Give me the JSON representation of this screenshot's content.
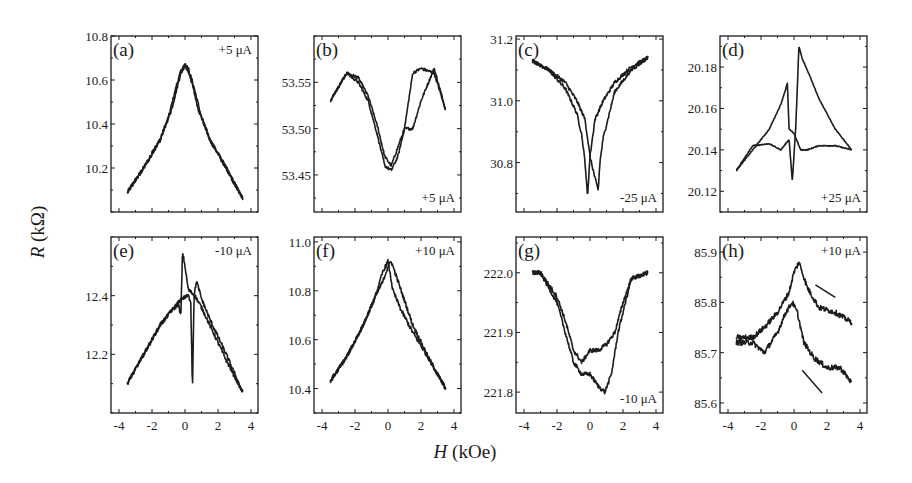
{
  "figure": {
    "ylabel_var": "R",
    "ylabel_unit": "(kΩ)",
    "xlabel_var": "H",
    "xlabel_unit": "(kOe)"
  },
  "chart_data": [
    {
      "panel": "(a)",
      "type": "line",
      "current": "+5 μA",
      "xlabel": "H (kOe)",
      "ylabel": "R (kΩ)",
      "xlim": [
        -4,
        4
      ],
      "ylim": [
        10.0,
        10.8
      ],
      "xticks": [
        -4,
        -2,
        0,
        2,
        4
      ],
      "xtick_labels_visible": false,
      "yticks": [
        10.2,
        10.4,
        10.6,
        10.8
      ],
      "ytick_labels": [
        "10.2",
        "10.4",
        "10.6",
        "10.8"
      ],
      "label_pos": "top-right",
      "noise": 0.012,
      "series": [
        {
          "name": "sweep up",
          "x": [
            -3.5,
            -2.5,
            -1.5,
            -1.0,
            -0.5,
            -0.2,
            0.0,
            0.3,
            0.8,
            1.5,
            2.5,
            3.5
          ],
          "y": [
            10.09,
            10.2,
            10.33,
            10.43,
            10.58,
            10.65,
            10.67,
            10.62,
            10.47,
            10.33,
            10.2,
            10.06
          ]
        },
        {
          "name": "sweep down",
          "x": [
            -3.5,
            -2.5,
            -1.5,
            -0.8,
            -0.3,
            0.0,
            0.2,
            0.5,
            1.0,
            1.5,
            2.5,
            3.5
          ],
          "y": [
            10.09,
            10.2,
            10.33,
            10.47,
            10.62,
            10.67,
            10.65,
            10.58,
            10.43,
            10.33,
            10.2,
            10.06
          ]
        }
      ]
    },
    {
      "panel": "(b)",
      "type": "line",
      "current": "+5 μA",
      "xlabel": "H (kOe)",
      "ylabel": "R (kΩ)",
      "xlim": [
        -4,
        4
      ],
      "ylim": [
        53.41,
        53.6
      ],
      "xticks": [
        -4,
        -2,
        0,
        2,
        4
      ],
      "xtick_labels_visible": false,
      "yticks": [
        53.45,
        53.5,
        53.55
      ],
      "ytick_labels": [
        "53.45",
        "53.50",
        "53.55"
      ],
      "label_pos": "bottom-right",
      "noise": 0.008,
      "series": [
        {
          "name": "sweep up",
          "x": [
            -3.5,
            -2.5,
            -1.8,
            -1.2,
            -0.6,
            -0.2,
            0.2,
            0.6,
            1.0,
            1.5,
            2.0,
            2.8,
            3.5
          ],
          "y": [
            53.53,
            53.56,
            53.555,
            53.535,
            53.5,
            53.47,
            53.46,
            53.48,
            53.5,
            53.5,
            53.53,
            53.565,
            53.52
          ]
        },
        {
          "name": "sweep down",
          "x": [
            -3.5,
            -2.5,
            -1.8,
            -1.2,
            -0.6,
            -0.2,
            0.2,
            0.6,
            1.0,
            1.5,
            2.0,
            2.8,
            3.5
          ],
          "y": [
            53.53,
            53.56,
            53.55,
            53.53,
            53.49,
            53.46,
            53.455,
            53.47,
            53.5,
            53.56,
            53.565,
            53.56,
            53.52
          ]
        }
      ]
    },
    {
      "panel": "(c)",
      "type": "line",
      "current": "-25 μA",
      "xlabel": "H (kOe)",
      "ylabel": "R (kΩ)",
      "xlim": [
        -4,
        4
      ],
      "ylim": [
        30.64,
        31.21
      ],
      "xticks": [
        -4,
        -2,
        0,
        2,
        4
      ],
      "xtick_labels_visible": false,
      "yticks": [
        30.8,
        31.0,
        31.2
      ],
      "ytick_labels": [
        "30.8",
        "31.0",
        "31.2"
      ],
      "label_pos": "bottom-right",
      "noise": 0.01,
      "series": [
        {
          "name": "sweep up",
          "x": [
            -3.5,
            -2.5,
            -1.5,
            -0.8,
            -0.5,
            -0.3,
            -0.15,
            0.0,
            0.3,
            0.8,
            1.5,
            2.5,
            3.5
          ],
          "y": [
            31.13,
            31.1,
            31.04,
            30.96,
            30.89,
            30.8,
            30.69,
            30.82,
            30.94,
            31.0,
            31.06,
            31.11,
            31.14
          ]
        },
        {
          "name": "sweep down",
          "x": [
            -3.5,
            -2.5,
            -1.5,
            -0.8,
            -0.3,
            0.0,
            0.3,
            0.5,
            0.6,
            0.8,
            1.5,
            2.5,
            3.5
          ],
          "y": [
            31.13,
            31.1,
            31.06,
            31.0,
            30.94,
            30.82,
            30.75,
            30.71,
            30.8,
            30.88,
            31.03,
            31.1,
            31.14
          ]
        }
      ]
    },
    {
      "panel": "(d)",
      "type": "line",
      "current": "+25 μA",
      "xlabel": "H (kOe)",
      "ylabel": "R (kΩ)",
      "xlim": [
        -4,
        4
      ],
      "ylim": [
        20.11,
        20.195
      ],
      "xticks": [
        -4,
        -2,
        0,
        2,
        4
      ],
      "xtick_labels_visible": false,
      "yticks": [
        20.12,
        20.14,
        20.16,
        20.18
      ],
      "ytick_labels": [
        "20.12",
        "20.14",
        "20.16",
        "20.18"
      ],
      "label_pos": "bottom-right",
      "noise": 0.0025,
      "series": [
        {
          "name": "sweep up",
          "x": [
            -3.5,
            -2.5,
            -1.5,
            -0.8,
            -0.4,
            -0.3,
            0.0,
            0.4,
            0.8,
            1.5,
            2.5,
            3.5
          ],
          "y": [
            20.13,
            20.14,
            20.15,
            20.162,
            20.172,
            20.15,
            20.148,
            20.14,
            20.14,
            20.142,
            20.142,
            20.14
          ]
        },
        {
          "name": "sweep down",
          "x": [
            -3.5,
            -2.5,
            -1.5,
            -0.8,
            -0.3,
            -0.1,
            0.1,
            0.3,
            0.5,
            1.0,
            1.5,
            2.5,
            3.5
          ],
          "y": [
            20.13,
            20.142,
            20.143,
            20.14,
            20.145,
            20.125,
            20.15,
            20.19,
            20.184,
            20.175,
            20.165,
            20.15,
            20.14
          ]
        }
      ]
    },
    {
      "panel": "(e)",
      "type": "line",
      "current": "-10 μA",
      "xlabel": "H (kOe)",
      "ylabel": "R (kΩ)",
      "xlim": [
        -4,
        4
      ],
      "ylim": [
        12.0,
        12.6
      ],
      "xticks": [
        -4,
        -2,
        0,
        2,
        4
      ],
      "xtick_labels": [
        "-4",
        "-2",
        "0",
        "2",
        "4"
      ],
      "xtick_labels_visible": true,
      "yticks": [
        12.2,
        12.4
      ],
      "ytick_labels": [
        "12.2",
        "12.4"
      ],
      "label_pos": "top-right",
      "noise": 0.011,
      "series": [
        {
          "name": "sweep up",
          "x": [
            -3.5,
            -2.5,
            -1.5,
            -0.8,
            -0.4,
            -0.25,
            -0.15,
            0.0,
            0.2,
            0.6,
            1.0,
            1.5,
            2.5,
            3.5
          ],
          "y": [
            12.1,
            12.2,
            12.3,
            12.35,
            12.37,
            12.33,
            12.55,
            12.5,
            12.42,
            12.4,
            12.36,
            12.3,
            12.18,
            12.07
          ]
        },
        {
          "name": "sweep down",
          "x": [
            -3.5,
            -2.5,
            -1.5,
            -0.8,
            -0.2,
            0.2,
            0.35,
            0.45,
            0.55,
            0.7,
            1.0,
            1.5,
            2.5,
            3.5
          ],
          "y": [
            12.1,
            12.2,
            12.3,
            12.35,
            12.39,
            12.4,
            12.38,
            12.08,
            12.4,
            12.45,
            12.39,
            12.32,
            12.2,
            12.07
          ]
        }
      ]
    },
    {
      "panel": "(f)",
      "type": "line",
      "current": "+10 μA",
      "xlabel": "H (kOe)",
      "ylabel": "R (kΩ)",
      "xlim": [
        -4,
        4
      ],
      "ylim": [
        10.3,
        11.02
      ],
      "xticks": [
        -4,
        -2,
        0,
        2,
        4
      ],
      "xtick_labels": [
        "-4",
        "-2",
        "0",
        "2",
        "4"
      ],
      "xtick_labels_visible": true,
      "yticks": [
        10.4,
        10.6,
        10.8,
        11.0
      ],
      "ytick_labels": [
        "10.4",
        "10.6",
        "10.8",
        "11.0"
      ],
      "label_pos": "top-right",
      "noise": 0.012,
      "series": [
        {
          "name": "sweep up",
          "x": [
            -3.5,
            -2.5,
            -1.5,
            -0.8,
            -0.3,
            0.0,
            0.3,
            0.8,
            1.5,
            2.5,
            3.5
          ],
          "y": [
            10.43,
            10.53,
            10.66,
            10.77,
            10.88,
            10.92,
            10.8,
            10.72,
            10.63,
            10.52,
            10.4
          ]
        },
        {
          "name": "sweep down",
          "x": [
            -3.5,
            -2.5,
            -1.5,
            -0.8,
            -0.3,
            0.0,
            0.2,
            0.6,
            1.0,
            1.5,
            2.5,
            3.5
          ],
          "y": [
            10.43,
            10.53,
            10.66,
            10.77,
            10.84,
            10.9,
            10.92,
            10.84,
            10.76,
            10.66,
            10.52,
            10.4
          ]
        }
      ]
    },
    {
      "panel": "(g)",
      "type": "line",
      "current": "-10 μA",
      "xlabel": "H (kOe)",
      "ylabel": "R (kΩ)",
      "xlim": [
        -4,
        4
      ],
      "ylim": [
        221.765,
        222.06
      ],
      "xticks": [
        -4,
        -2,
        0,
        2,
        4
      ],
      "xtick_labels": [
        "-4",
        "-2",
        "0",
        "2",
        "4"
      ],
      "xtick_labels_visible": true,
      "yticks": [
        221.8,
        221.9,
        222.0
      ],
      "ytick_labels": [
        "221.8",
        "221.9",
        "222.0"
      ],
      "label_pos": "bottom-right",
      "noise": 0.012,
      "series": [
        {
          "name": "sweep up",
          "x": [
            -3.5,
            -3.0,
            -2.0,
            -1.5,
            -1.0,
            -0.5,
            0.0,
            0.5,
            1.0,
            1.5,
            2.0,
            2.5,
            3.5
          ],
          "y": [
            222.0,
            222.0,
            221.96,
            221.92,
            221.87,
            221.85,
            221.87,
            221.87,
            221.88,
            221.9,
            221.95,
            221.99,
            222.0
          ]
        },
        {
          "name": "sweep down",
          "x": [
            -3.5,
            -3.0,
            -2.0,
            -1.5,
            -1.0,
            -0.5,
            0.0,
            0.5,
            0.9,
            1.3,
            1.7,
            2.5,
            3.5
          ],
          "y": [
            222.0,
            222.0,
            221.95,
            221.9,
            221.85,
            221.83,
            221.83,
            221.81,
            221.8,
            221.83,
            221.9,
            221.99,
            222.0
          ]
        }
      ]
    },
    {
      "panel": "(h)",
      "type": "line",
      "current": "+10 μA",
      "xlabel": "H (kOe)",
      "ylabel": "R (kΩ)",
      "xlim": [
        -4,
        4
      ],
      "ylim": [
        85.58,
        85.93
      ],
      "xticks": [
        -4,
        -2,
        0,
        2,
        4
      ],
      "xtick_labels": [
        "-4",
        "-2",
        "0",
        "2",
        "4"
      ],
      "xtick_labels_visible": true,
      "yticks": [
        85.6,
        85.7,
        85.8,
        85.9
      ],
      "ytick_labels": [
        "85.6",
        "85.7",
        "85.8",
        "85.9"
      ],
      "label_pos": "top-right",
      "noise": 0.015,
      "annotations": [
        "arrow upper branch (down-right, near H≈1.5–2.5)",
        "arrow lower branch (down-right, near H≈0.8–2)"
      ],
      "series": [
        {
          "name": "upper branch",
          "x": [
            -3.5,
            -2.5,
            -1.8,
            -1.0,
            -0.3,
            0.0,
            0.3,
            0.8,
            1.5,
            2.5,
            3.5
          ],
          "y": [
            85.73,
            85.73,
            85.75,
            85.78,
            85.82,
            85.86,
            85.88,
            85.83,
            85.79,
            85.78,
            85.76
          ]
        },
        {
          "name": "lower branch",
          "x": [
            -3.5,
            -2.5,
            -1.8,
            -1.0,
            -0.5,
            -0.1,
            0.2,
            0.6,
            1.2,
            2.0,
            2.8,
            3.5
          ],
          "y": [
            85.72,
            85.72,
            85.7,
            85.74,
            85.78,
            85.8,
            85.78,
            85.72,
            85.69,
            85.67,
            85.67,
            85.64
          ]
        }
      ]
    }
  ]
}
